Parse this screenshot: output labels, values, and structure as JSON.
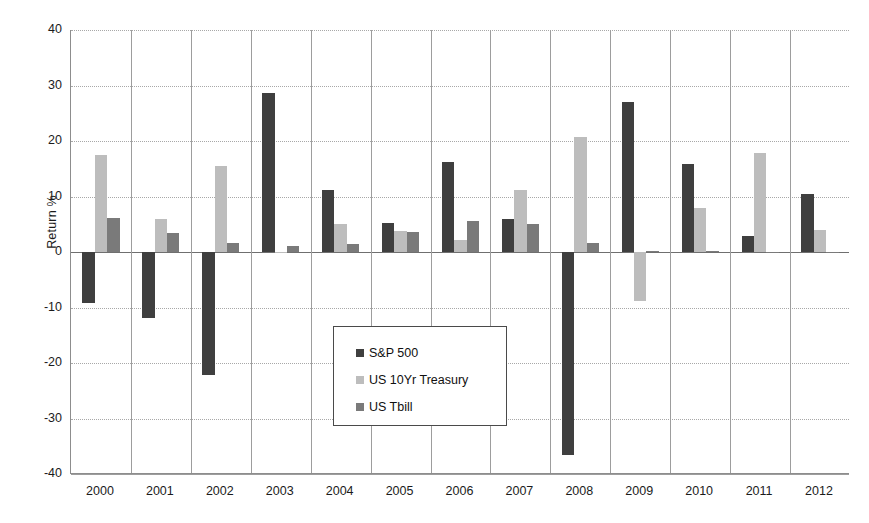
{
  "chart_data": {
    "type": "bar",
    "title": "",
    "xlabel": "",
    "ylabel": "Return %",
    "ylim": [
      -40,
      40
    ],
    "ytick_step": 10,
    "yticks": [
      "40",
      "30",
      "20",
      "10",
      "0",
      "-10",
      "-20",
      "-30",
      "-40"
    ],
    "grid": true,
    "grid_orientation": "both",
    "legend_position": "inside-center-lower",
    "categories": [
      "2000",
      "2001",
      "2002",
      "2003",
      "2004",
      "2005",
      "2006",
      "2007",
      "2008",
      "2009",
      "2010",
      "2011",
      "2012"
    ],
    "series": [
      {
        "name": "S&P 500",
        "color": "#3f3f3f",
        "values": [
          -9.1,
          -11.9,
          -22.1,
          28.7,
          11.2,
          5.2,
          16.2,
          6.0,
          -36.5,
          27.0,
          15.8,
          2.8,
          10.4
        ]
      },
      {
        "name": "US 10Yr Treasury",
        "color": "#bdbdbd",
        "values": [
          17.4,
          5.9,
          15.5,
          0.0,
          5.0,
          3.7,
          2.2,
          11.1,
          20.7,
          -8.8,
          8.0,
          17.8,
          4.0
        ]
      },
      {
        "name": "US Tbill",
        "color": "#7a7a7a",
        "values": [
          6.1,
          3.4,
          1.7,
          1.1,
          1.5,
          3.6,
          5.5,
          5.0,
          1.6,
          0.2,
          0.1,
          0.05,
          0.05
        ]
      }
    ]
  },
  "axis": {
    "y_label": "Return %"
  },
  "legend": {
    "items": [
      {
        "label": "S&P 500",
        "color": "#3f3f3f"
      },
      {
        "label": "US 10Yr Treasury",
        "color": "#bdbdbd"
      },
      {
        "label": "US Tbill",
        "color": "#7a7a7a"
      }
    ]
  }
}
